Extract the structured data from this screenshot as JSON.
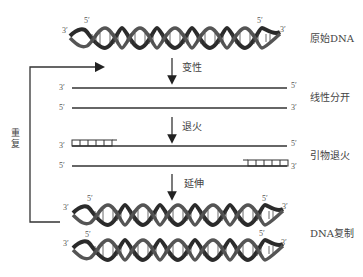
{
  "diagram": {
    "stages": [
      {
        "id": "original",
        "label": "原始DNA"
      },
      {
        "id": "separated",
        "label": "线性分开"
      },
      {
        "id": "annealed",
        "label": "引物退火"
      },
      {
        "id": "replicated",
        "label": "DNA复制"
      }
    ],
    "steps": [
      {
        "id": "denature",
        "label": "变性"
      },
      {
        "id": "anneal",
        "label": "退火"
      },
      {
        "id": "extend",
        "label": "延伸"
      }
    ],
    "loop_label": "重复",
    "end_labels": {
      "three_prime": "3′",
      "five_prime": "5′"
    },
    "colors": {
      "strand": "#333333",
      "helix_dark": "#2b2b2b",
      "helix_light": "#6a6a6a",
      "text": "#444444"
    }
  }
}
